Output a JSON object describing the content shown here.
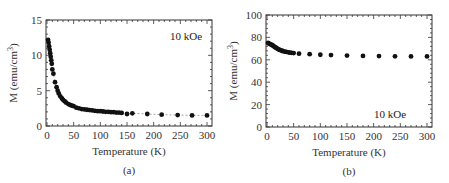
{
  "figure": {
    "panels": [
      "(a)",
      "(b)"
    ]
  },
  "chart_data": [
    {
      "type": "scatter",
      "panel": "(a)",
      "title": "",
      "annotation": "10 kOe",
      "xlabel": "Temperature (K)",
      "ylabel": "M (emu/cm³)",
      "ylabel_base": "M (emu/cm",
      "ylabel_sup": "3",
      "ylabel_close": ")",
      "xlim": [
        0,
        300
      ],
      "ylim": [
        0,
        15
      ],
      "xticks": [
        0,
        50,
        100,
        150,
        200,
        250,
        300
      ],
      "yticks": [
        0,
        5,
        10,
        15
      ],
      "grid": false,
      "connected_dashed": true,
      "caption": "(a)",
      "series": [
        {
          "name": "M vs T",
          "x": [
            2,
            3,
            4,
            5,
            6,
            7,
            8,
            9,
            10,
            12,
            15,
            18,
            20,
            22,
            25,
            28,
            30,
            33,
            36,
            40,
            43,
            46,
            50,
            55,
            60,
            65,
            70,
            75,
            80,
            85,
            90,
            95,
            100,
            105,
            110,
            115,
            120,
            125,
            130,
            135,
            140,
            150,
            160,
            188,
            215,
            245,
            272,
            300
          ],
          "y": [
            12.2,
            11.8,
            11.3,
            10.8,
            10.3,
            9.8,
            9.3,
            8.8,
            8.0,
            7.4,
            6.2,
            5.5,
            5.0,
            4.6,
            4.2,
            3.9,
            3.7,
            3.5,
            3.3,
            3.1,
            3.0,
            2.9,
            2.8,
            2.6,
            2.5,
            2.4,
            2.35,
            2.3,
            2.25,
            2.2,
            2.15,
            2.1,
            2.1,
            2.05,
            2.0,
            2.0,
            1.95,
            1.95,
            1.9,
            1.9,
            1.85,
            1.7,
            1.8,
            1.7,
            1.6,
            1.55,
            1.5,
            1.5
          ]
        }
      ]
    },
    {
      "type": "scatter",
      "panel": "(b)",
      "title": "",
      "annotation": "10 kOe",
      "xlabel": "Temperature (K)",
      "ylabel": "M (emu/cm³)",
      "ylabel_base": "M (emu/cm",
      "ylabel_sup": "3",
      "ylabel_close": ")",
      "xlim": [
        0,
        300
      ],
      "ylim": [
        0,
        100
      ],
      "xticks": [
        0,
        50,
        100,
        150,
        200,
        250,
        300
      ],
      "yticks": [
        0,
        20,
        40,
        60,
        80,
        100
      ],
      "grid": false,
      "connected_dashed": false,
      "caption": "(b)",
      "series": [
        {
          "name": "M vs T",
          "x": [
            2,
            4,
            6,
            8,
            10,
            12,
            14,
            16,
            18,
            20,
            22,
            25,
            28,
            30,
            33,
            36,
            40,
            43,
            46,
            50,
            60,
            80,
            100,
            120,
            150,
            180,
            210,
            240,
            270,
            300
          ],
          "y": [
            75,
            74.5,
            74,
            73.5,
            73,
            72.3,
            71.6,
            71,
            70.4,
            69.8,
            69.2,
            68.6,
            68.1,
            67.7,
            67.3,
            67,
            66.7,
            66.4,
            66.2,
            66,
            65.5,
            65,
            64.5,
            64.2,
            63.8,
            63.5,
            63.3,
            63.1,
            63,
            63
          ]
        }
      ]
    }
  ]
}
